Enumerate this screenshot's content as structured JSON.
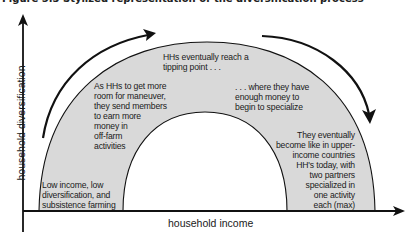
{
  "figure": {
    "title": "Figure 5.3  Stylized representation of the diversification process"
  },
  "axes": {
    "y_label": "household diversification",
    "x_label": "household income"
  },
  "stages": [
    {
      "id": "low",
      "text": "Low income, low\ndiversification, and\nsubsistence farming"
    },
    {
      "id": "room",
      "text": "As HHs to get more\nroom for maneuver,\nthey send members\nto earn more\nmoney in\noff-farm\nactivities"
    },
    {
      "id": "tipping",
      "text": "HHs eventually reach a\ntipping point . . ."
    },
    {
      "id": "special",
      "text": ". . . where they have\nenough money to\nbegin to specialize"
    },
    {
      "id": "upper",
      "text": "They eventually\nbecome like in upper-\nincome countries\nHH's today, with\ntwo partners\nspecialized in\none activity\neach (max)"
    }
  ],
  "colors": {
    "arch_fill": "#d9d9d9",
    "stroke": "#111111",
    "background": "#ffffff"
  }
}
